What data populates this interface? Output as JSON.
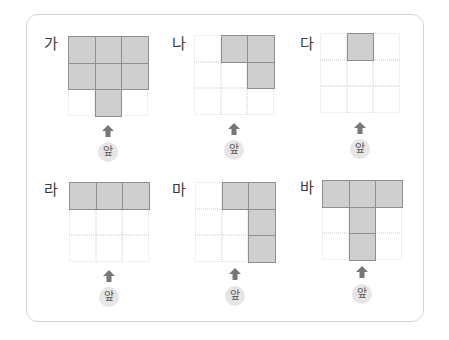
{
  "figure": {
    "front_label": "앞",
    "front_arrow_icon": "arrow-up-icon",
    "grid_size": [
      3,
      3
    ],
    "colors": {
      "filled_cell": "#cfcfcf",
      "filled_border": "#8f8f8f",
      "empty_grid_line": "#e2e2e2",
      "arrow": "#777777",
      "badge_bg": "#e6e6e6",
      "card_border": "#d4d4d4"
    },
    "panels": [
      {
        "label": "가",
        "filled_cells": [
          [
            0,
            0
          ],
          [
            0,
            1
          ],
          [
            0,
            2
          ],
          [
            1,
            0
          ],
          [
            1,
            1
          ],
          [
            1,
            2
          ],
          [
            2,
            1
          ]
        ]
      },
      {
        "label": "나",
        "filled_cells": [
          [
            0,
            1
          ],
          [
            0,
            2
          ],
          [
            1,
            2
          ]
        ]
      },
      {
        "label": "다",
        "filled_cells": [
          [
            0,
            1
          ]
        ]
      },
      {
        "label": "라",
        "filled_cells": [
          [
            0,
            0
          ],
          [
            0,
            1
          ],
          [
            0,
            2
          ]
        ]
      },
      {
        "label": "마",
        "filled_cells": [
          [
            0,
            1
          ],
          [
            0,
            2
          ],
          [
            1,
            2
          ],
          [
            2,
            2
          ]
        ]
      },
      {
        "label": "바",
        "filled_cells": [
          [
            0,
            0
          ],
          [
            0,
            1
          ],
          [
            0,
            2
          ],
          [
            1,
            1
          ],
          [
            2,
            1
          ]
        ]
      }
    ]
  }
}
